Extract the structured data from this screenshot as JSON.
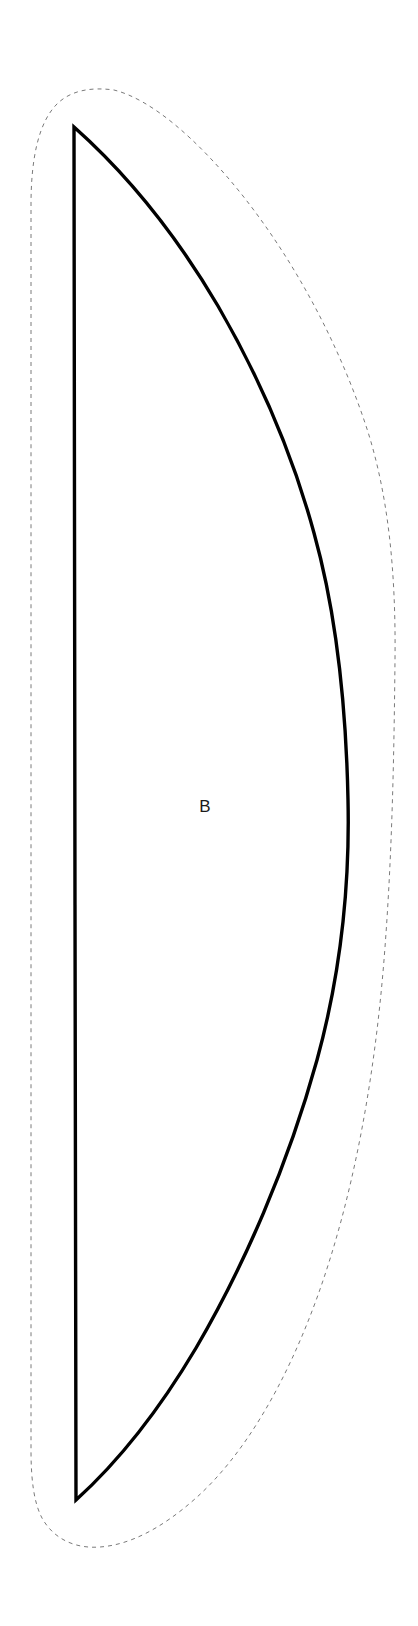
{
  "document": {
    "type": "sewing-pattern-piece",
    "background_color": "#ffffff",
    "width": 418,
    "height": 1626
  },
  "piece": {
    "label": "B",
    "label_x": 205,
    "label_y": 808,
    "cut_line_color": "#000000",
    "cut_line_width": 3.4,
    "seam_line_color": "#7a7a7a",
    "seam_line_width": 1,
    "seam_dash": "4 4",
    "seam_allowance_px": 45
  },
  "chart_data": {
    "type": "line",
    "xlabel": "",
    "ylabel": "",
    "grid": false,
    "legend": "none",
    "xlim": [
      0,
      418
    ],
    "ylim": [
      0,
      1626
    ],
    "series": [
      {
        "name": "cut-line-straight-edge",
        "style": "solid",
        "color": "#000000",
        "x": [
          74,
          74,
          76
        ],
        "y": [
          127,
          900,
          1500
        ]
      },
      {
        "name": "cut-line-curved-edge",
        "style": "solid",
        "color": "#000000",
        "x": [
          74,
          180,
          255,
          310,
          340,
          348,
          345,
          320,
          265,
          180,
          110,
          76
        ],
        "y": [
          127,
          262,
          400,
          540,
          660,
          790,
          920,
          1080,
          1250,
          1390,
          1465,
          1500
        ]
      },
      {
        "name": "seam-allowance-outline",
        "style": "dashed",
        "color": "#7a7a7a",
        "x": [
          31,
          31,
          34,
          47,
          76,
          112,
          150,
          200,
          260,
          320,
          362,
          388,
          394,
          390,
          372,
          338,
          286,
          222,
          160,
          108,
          72,
          46,
          33,
          31
        ],
        "y": [
          430,
          200,
          140,
          108,
          90,
          88,
          106,
          152,
          230,
          340,
          460,
          600,
          790,
          960,
          1110,
          1250,
          1370,
          1460,
          1515,
          1542,
          1548,
          1536,
          1505,
          1430
        ]
      }
    ],
    "annotations": [
      {
        "text": "B",
        "x": 205,
        "y": 808
      }
    ]
  }
}
